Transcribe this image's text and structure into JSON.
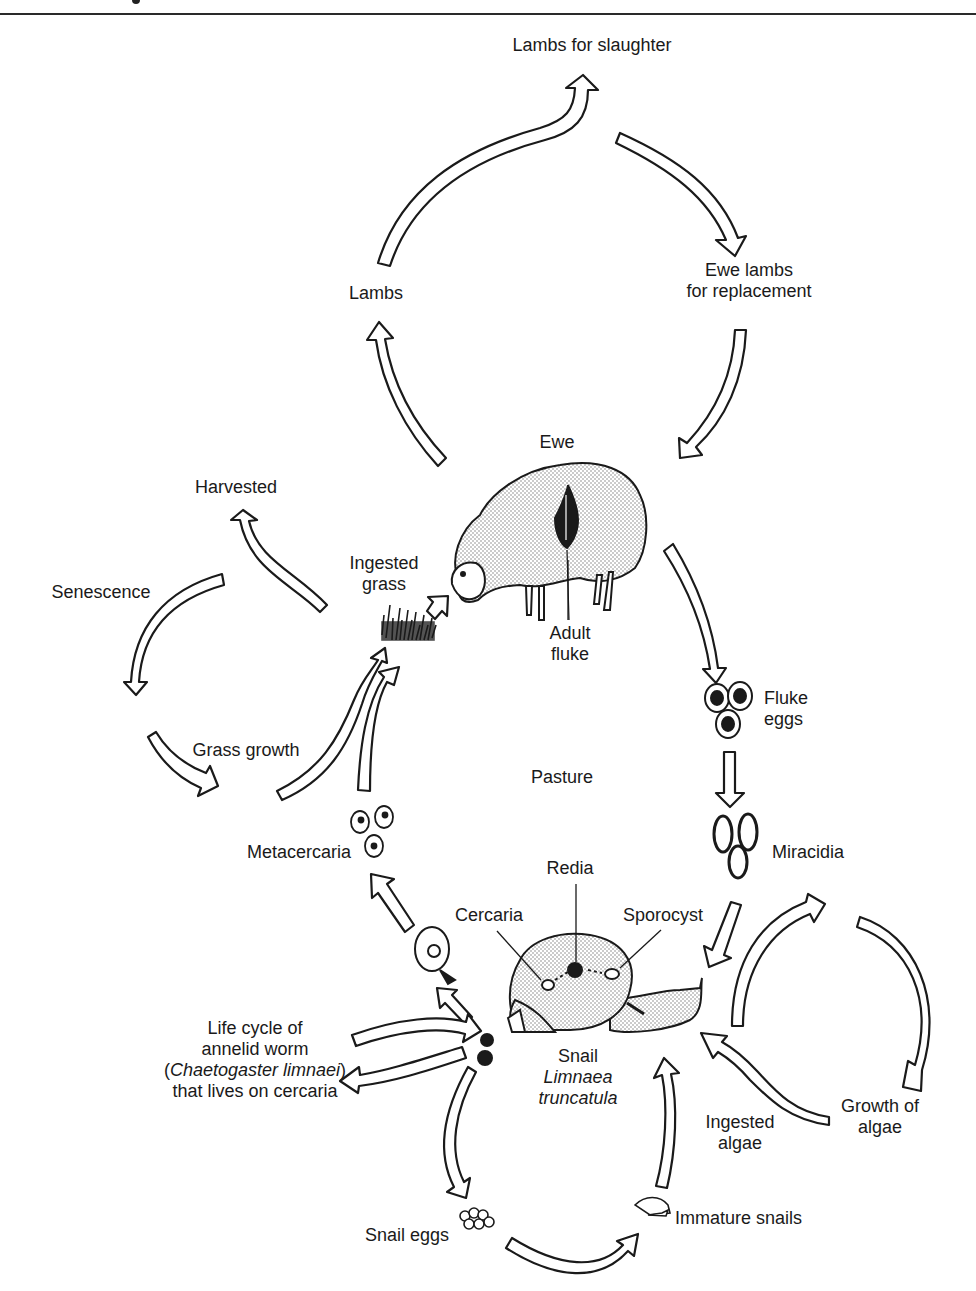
{
  "figure": {
    "domain": "life-cycle-diagram",
    "center_label": "Pasture",
    "colors": {
      "ink": "#1a1a1a",
      "stipple": "#d6d6d6",
      "paper": "#ffffff"
    }
  },
  "labels": {
    "lambs_for_slaughter": "Lambs for slaughter",
    "lambs": "Lambs",
    "ewe_lambs_line1": "Ewe lambs",
    "ewe_lambs_line2": "for replacement",
    "ewe": "Ewe",
    "harvested": "Harvested",
    "senescence": "Senescence",
    "ingested_grass_line1": "Ingested",
    "ingested_grass_line2": "grass",
    "adult_fluke_line1": "Adult",
    "adult_fluke_line2": "fluke",
    "fluke_eggs_line1": "Fluke",
    "fluke_eggs_line2": "eggs",
    "grass_growth": "Grass growth",
    "pasture": "Pasture",
    "metacercaria": "Metacercaria",
    "miracidia": "Miracidia",
    "redia": "Redia",
    "cercaria": "Cercaria",
    "sporocyst": "Sporocyst",
    "annelid_line1": "Life cycle of",
    "annelid_line2": "annelid worm",
    "annelid_line3_open": "(",
    "annelid_line3_italic": "Chaetogaster limnaei",
    "annelid_line3_close": ")",
    "annelid_line4": "that lives on cercaria",
    "snail": "Snail",
    "snail_species_line1": "Limnaea",
    "snail_species_line2": "truncatula",
    "ingested_algae_line1": "Ingested",
    "ingested_algae_line2": "algae",
    "growth_of_algae_line1": "Growth of",
    "growth_of_algae_line2": "algae",
    "snail_eggs": "Snail eggs",
    "immature_snails": "Immature snails"
  }
}
